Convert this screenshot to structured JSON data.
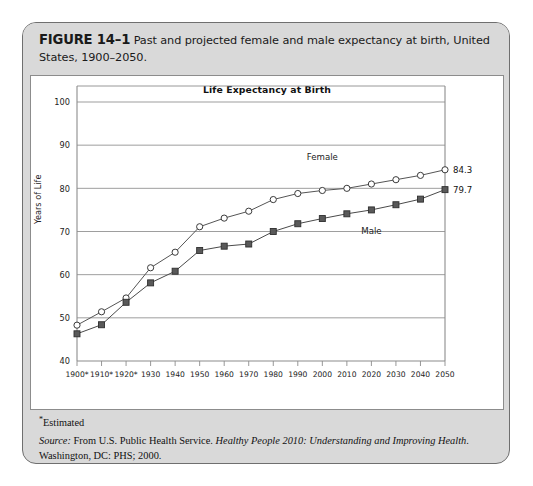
{
  "figure": {
    "label": "FIGURE 14–1",
    "caption": "Past and projected female and male expectancy at birth, United States, 1900–2050."
  },
  "chart_data": {
    "type": "line",
    "title": "Life Expectancy at Birth",
    "xlabel": "",
    "ylabel": "Years of Life",
    "ylim": [
      40,
      100
    ],
    "ytick_step": 10,
    "yticks": [
      "40",
      "50",
      "60",
      "70",
      "80",
      "90",
      "100"
    ],
    "grid": true,
    "legend": "inline-series-labels",
    "x": [
      1900,
      1910,
      1920,
      1930,
      1940,
      1950,
      1960,
      1970,
      1980,
      1990,
      2000,
      2010,
      2020,
      2030,
      2040,
      2050
    ],
    "categories": [
      "1900*",
      "1910*",
      "1920*",
      "1930",
      "1940",
      "1950",
      "1960",
      "1970",
      "1980",
      "1990",
      "2000",
      "2010",
      "2020",
      "2030",
      "2040",
      "2050"
    ],
    "series": [
      {
        "name": "Female",
        "marker": "open-circle",
        "color": "#555555",
        "end_label": "84.3",
        "values": [
          48.3,
          51.4,
          54.6,
          61.6,
          65.2,
          71.1,
          73.1,
          74.7,
          77.4,
          78.8,
          79.5,
          80.0,
          81.0,
          82.0,
          83.0,
          84.3
        ]
      },
      {
        "name": "Male",
        "marker": "filled-square",
        "color": "#4a4a4a",
        "end_label": "79.7",
        "values": [
          46.3,
          48.4,
          53.6,
          58.1,
          60.8,
          65.6,
          66.6,
          67.1,
          70.0,
          71.8,
          73.0,
          74.1,
          75.0,
          76.2,
          77.5,
          79.7
        ]
      }
    ],
    "annotations": [
      {
        "text": "Female",
        "x": 2000,
        "y": 86.5
      },
      {
        "text": "Male",
        "x": 2020,
        "y": 69.5
      }
    ]
  },
  "footer": {
    "estimated_marker": "*",
    "estimated_text": "Estimated",
    "source_label": "Source:",
    "source_pre": " From U.S. Public Health Service. ",
    "source_italic": "Healthy People 2010: Understanding and Improving Health",
    "source_post": ". Washington, DC: PHS; 2000."
  }
}
